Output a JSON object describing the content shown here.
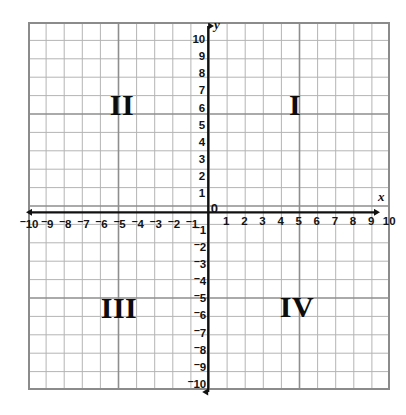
{
  "figure": {
    "kind": "coordinate-plane",
    "background_color": "#ffffff",
    "grid": {
      "minor_line_color": "#b4b4b4",
      "major_line_color": "#8b8b8b",
      "border_color": "#8b8b8b",
      "cells_x": 20,
      "cells_y": 20,
      "cell_px": 18.1
    },
    "axis_color": "#111111"
  },
  "axes": {
    "x_label": "x",
    "y_label": "y",
    "origin_label": "0",
    "x_min": -10,
    "x_max": 10,
    "y_min": -10,
    "y_max": 10,
    "x_ticks_negative": [
      "10",
      "9",
      "8",
      "7",
      "6",
      "5",
      "4",
      "3",
      "2",
      "1"
    ],
    "x_ticks_positive": [
      "1",
      "2",
      "3",
      "4",
      "5",
      "6",
      "7",
      "8",
      "9",
      "10"
    ],
    "y_ticks_positive": [
      "1",
      "2",
      "3",
      "4",
      "5",
      "6",
      "7",
      "8",
      "9",
      "10"
    ],
    "y_ticks_negative": [
      "1",
      "2",
      "3",
      "4",
      "5",
      "6",
      "7",
      "8",
      "9",
      "10"
    ],
    "negative_sign": "–"
  },
  "quadrants": [
    {
      "label": "I",
      "name": "quadrant-one",
      "x": 295,
      "y": 105
    },
    {
      "label": "II",
      "name": "quadrant-two",
      "x": 122,
      "y": 105
    },
    {
      "label": "III",
      "name": "quadrant-three",
      "x": 119,
      "y": 308
    },
    {
      "label": "IV",
      "name": "quadrant-four",
      "x": 297,
      "y": 307
    }
  ],
  "chart_data": {
    "type": "scatter",
    "title": "",
    "xlabel": "x",
    "ylabel": "y",
    "xlim": [
      -10,
      10
    ],
    "ylim": [
      -10,
      10
    ],
    "xticks": [
      -10,
      -9,
      -8,
      -7,
      -6,
      -5,
      -4,
      -3,
      -2,
      -1,
      0,
      1,
      2,
      3,
      4,
      5,
      6,
      7,
      8,
      9,
      10
    ],
    "yticks": [
      -10,
      -9,
      -8,
      -7,
      -6,
      -5,
      -4,
      -3,
      -2,
      -1,
      0,
      1,
      2,
      3,
      4,
      5,
      6,
      7,
      8,
      9,
      10
    ],
    "grid": true,
    "legend": null,
    "series": [],
    "annotations": [
      {
        "text": "I",
        "x": 5,
        "y": 6
      },
      {
        "text": "II",
        "x": -5,
        "y": 6
      },
      {
        "text": "III",
        "x": -5,
        "y": -5
      },
      {
        "text": "IV",
        "x": 5,
        "y": -5
      }
    ]
  }
}
